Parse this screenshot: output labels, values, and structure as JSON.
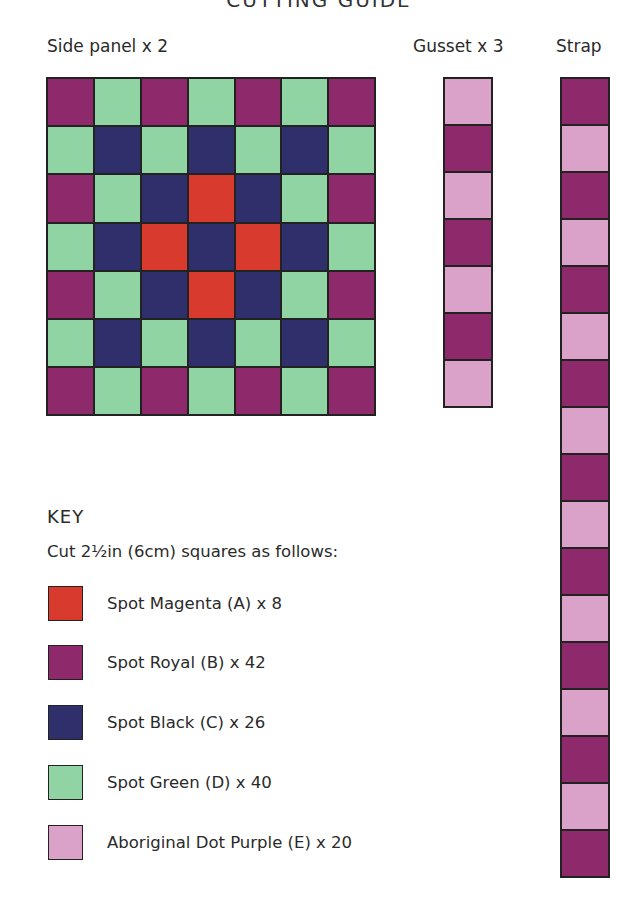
{
  "title": "CUTTING GUIDE",
  "colors": {
    "A": "#d83a2e",
    "B": "#8e2a6b",
    "C": "#2f2f6b",
    "D": "#8fd4a2",
    "E": "#daa2c9"
  },
  "side_panel": {
    "label": "Side panel x 2",
    "rows": [
      [
        "B",
        "D",
        "B",
        "D",
        "B",
        "D",
        "B"
      ],
      [
        "D",
        "C",
        "D",
        "C",
        "D",
        "C",
        "D"
      ],
      [
        "B",
        "D",
        "C",
        "A",
        "C",
        "D",
        "B"
      ],
      [
        "D",
        "C",
        "A",
        "C",
        "A",
        "C",
        "D"
      ],
      [
        "B",
        "D",
        "C",
        "A",
        "C",
        "D",
        "B"
      ],
      [
        "D",
        "C",
        "D",
        "C",
        "D",
        "C",
        "D"
      ],
      [
        "B",
        "D",
        "B",
        "D",
        "B",
        "D",
        "B"
      ]
    ]
  },
  "gusset": {
    "label": "Gusset x 3",
    "cells": [
      "E",
      "B",
      "E",
      "B",
      "E",
      "B",
      "E"
    ]
  },
  "strap": {
    "label": "Strap",
    "cells": [
      "B",
      "E",
      "B",
      "E",
      "B",
      "E",
      "B",
      "E",
      "B",
      "E",
      "B",
      "E",
      "B",
      "E",
      "B",
      "E",
      "B"
    ]
  },
  "key": {
    "title": "KEY",
    "subtitle": "Cut 2½in (6cm) squares as follows:",
    "items": [
      {
        "code": "A",
        "label": "Spot Magenta (A) x 8"
      },
      {
        "code": "B",
        "label": "Spot Royal (B) x 42"
      },
      {
        "code": "C",
        "label": "Spot Black (C) x 26"
      },
      {
        "code": "D",
        "label": "Spot Green (D) x 40"
      },
      {
        "code": "E",
        "label": "Aboriginal Dot Purple (E) x 20"
      }
    ]
  }
}
